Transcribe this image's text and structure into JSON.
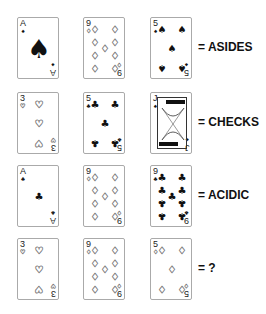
{
  "rows": [
    {
      "cards": [
        {
          "rank": "A",
          "suit": "♠",
          "suit_name": "spades"
        },
        {
          "rank": "9",
          "suit": "♢",
          "suit_name": "diamonds"
        },
        {
          "rank": "5",
          "suit": "♠",
          "suit_name": "spades"
        }
      ],
      "answer": "= ASIDES"
    },
    {
      "cards": [
        {
          "rank": "3",
          "suit": "♡",
          "suit_name": "hearts"
        },
        {
          "rank": "5",
          "suit": "♣",
          "suit_name": "clubs"
        },
        {
          "rank": "J",
          "suit": "♠",
          "suit_name": "spades"
        }
      ],
      "answer": "= CHECKS"
    },
    {
      "cards": [
        {
          "rank": "A",
          "suit": "♣",
          "suit_name": "clubs"
        },
        {
          "rank": "9",
          "suit": "♢",
          "suit_name": "diamonds"
        },
        {
          "rank": "9",
          "suit": "♣",
          "suit_name": "clubs"
        }
      ],
      "answer": "= ACIDIC"
    },
    {
      "cards": [
        {
          "rank": "3",
          "suit": "♡",
          "suit_name": "hearts"
        },
        {
          "rank": "9",
          "suit": "♢",
          "suit_name": "diamonds"
        },
        {
          "rank": "5",
          "suit": "♢",
          "suit_name": "diamonds"
        }
      ],
      "answer": "= ?"
    }
  ]
}
